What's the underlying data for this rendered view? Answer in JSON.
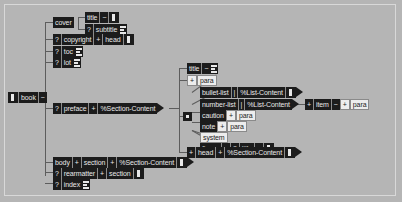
{
  "diagram": {
    "type": "element-structure-tree",
    "colors": {
      "background": "#b5b5b5",
      "node_dark_bg": "#1c1c1c",
      "node_dark_fg": "#e8e8e8",
      "node_light_bg": "#ededed",
      "node_light_fg": "#1c1c1c",
      "connector": "#5d5d5d",
      "frame": "#d8d8d8"
    },
    "symbols": {
      "optional": "?",
      "required_one": "+",
      "repeat": "~",
      "sequence_bar": "|",
      "content_icon": "lines-icon"
    }
  },
  "nodes": {
    "book": {
      "label": "book",
      "mod": "~"
    },
    "cover": {
      "label": "cover"
    },
    "cover_title": {
      "label": "title",
      "mod": "~"
    },
    "cover_subtitle": {
      "opt": "?",
      "label": "subtitle"
    },
    "copyright": {
      "opt": "?",
      "label": "copyright",
      "mod": "+",
      "child": "head"
    },
    "toc": {
      "opt": "?",
      "label": "toc"
    },
    "lot": {
      "opt": "?",
      "label": "lot"
    },
    "preface": {
      "opt": "?",
      "label": "preface",
      "mod": "+",
      "child": "%Section-Content"
    },
    "sect_title": {
      "label": "title",
      "mod": "~"
    },
    "sect_para": {
      "mod": "+",
      "label": "para"
    },
    "bullet_list": {
      "label": "bullet-list",
      "sep": "|",
      "child": "%List-Content"
    },
    "number_list": {
      "label": "number-list",
      "sep": "|",
      "child": "%List-Content"
    },
    "item": {
      "mod": "+",
      "label": "item",
      "rep": "~",
      "child_mod": "+",
      "child": "para"
    },
    "caution": {
      "label": "caution",
      "child_mod": "+",
      "child": "para"
    },
    "note": {
      "label": "note",
      "child_mod": "+",
      "child": "para"
    },
    "system": {
      "label": "system"
    },
    "figure": {
      "label": "figure",
      "mod": "~",
      "opt": "?",
      "child": "title",
      "child_mod": "~"
    },
    "head_sect": {
      "mod": "+",
      "label": "head",
      "sep_mod": "+",
      "child": "%Section-Content"
    },
    "body": {
      "label": "body",
      "mod": "+",
      "label2": "section",
      "sep_mod": "+",
      "child": "%Section-Content"
    },
    "rearmatter": {
      "opt": "?",
      "label": "rearmatter",
      "mod": "+",
      "label2": "section"
    },
    "index": {
      "opt": "?",
      "label": "index"
    }
  }
}
